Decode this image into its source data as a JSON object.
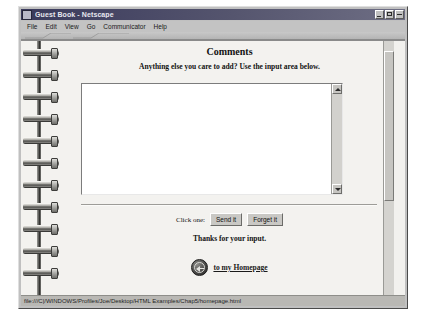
{
  "window": {
    "title": "Guest Book - Netscape",
    "icon": "netscape-document-icon",
    "controls": [
      {
        "name": "minimize",
        "glyph": "minimize-icon"
      },
      {
        "name": "maximize",
        "glyph": "maximize-icon"
      },
      {
        "name": "close",
        "glyph": "close-icon"
      }
    ]
  },
  "menubar": {
    "items": [
      {
        "label": "File"
      },
      {
        "label": "Edit"
      },
      {
        "label": "View"
      },
      {
        "label": "Go"
      },
      {
        "label": "Communicator"
      },
      {
        "label": "Help"
      }
    ]
  },
  "page": {
    "heading": "Comments",
    "subtitle": "Anything else you care to add? Use the input area below.",
    "comments_value": "",
    "comments_placeholder": "",
    "form": {
      "prompt": "Click one:",
      "submit_label": "Send it",
      "reset_label": "Forget it"
    },
    "thanks": "Thanks for your input.",
    "home_link": {
      "icon": "back-arrow-icon",
      "label": "to my Homepage"
    }
  },
  "statusbar": {
    "url": "file:///C|/WINDOWS/Profiles/Joe/Desktop/HTML Examples/Chap5/homepage.html"
  },
  "colors": {
    "window_face": "#c0c0c0",
    "title_gradient_start": "#3a3a5c",
    "page_background": "#f3f2ef",
    "text": "#121212"
  }
}
